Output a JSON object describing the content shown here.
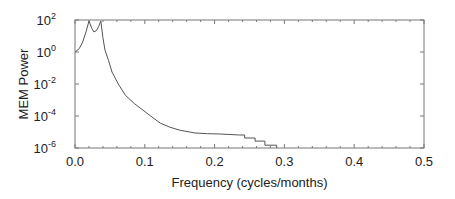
{
  "chart_data": {
    "type": "line",
    "title": "",
    "xlabel": "Frequency (cycles/months)",
    "ylabel": "MEM Power",
    "xlim": [
      0.0,
      0.5
    ],
    "ylim": [
      1e-06,
      100
    ],
    "yscale": "log",
    "grid": false,
    "legend": null,
    "x_ticks": [
      "0.0",
      "0.1",
      "0.2",
      "0.3",
      "0.4",
      "0.5"
    ],
    "y_ticks": [
      {
        "base": "10",
        "exp": "2"
      },
      {
        "base": "10",
        "exp": "0"
      },
      {
        "base": "10",
        "exp": "-2"
      },
      {
        "base": "10",
        "exp": "-4"
      },
      {
        "base": "10",
        "exp": "-6"
      }
    ],
    "series": [
      {
        "name": "MEM spectrum",
        "color": "#555555",
        "x": [
          0.0,
          0.006,
          0.011,
          0.016,
          0.02,
          0.024,
          0.027,
          0.031,
          0.034,
          0.037,
          0.04,
          0.043,
          0.048,
          0.053,
          0.062,
          0.072,
          0.085,
          0.103,
          0.122,
          0.136,
          0.15,
          0.172,
          0.19,
          0.208,
          0.222,
          0.236,
          0.243,
          0.243,
          0.258,
          0.258,
          0.272,
          0.272,
          0.289,
          0.289
        ],
        "values": [
          1.0,
          1.6,
          4.2,
          20,
          87,
          30,
          18,
          22,
          40,
          87,
          8,
          1.3,
          0.3,
          0.056,
          0.01,
          0.002,
          0.0006,
          0.00015,
          3.6e-05,
          2e-05,
          1.3e-05,
          8.7e-06,
          7.8e-06,
          7.5e-06,
          7e-06,
          6.5e-06,
          6.5e-06,
          4.2e-06,
          4.2e-06,
          2.7e-06,
          2.7e-06,
          1.5e-06,
          1.5e-06,
          1e-06
        ]
      }
    ]
  }
}
